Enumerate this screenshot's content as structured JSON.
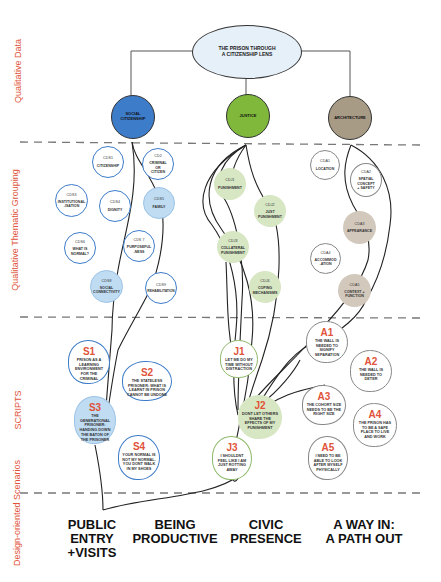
{
  "title": "THE PRISON THROUGH A CITIZENSHIP LENS",
  "colors": {
    "accent_red": "#e0533a",
    "social_citizenship": "#3d7cc9",
    "justice": "#7fb83a",
    "architecture": "#a89b85",
    "light_blue": "#bfdcf3",
    "light_green": "#d7e6c3",
    "light_tan": "#d2c8bc"
  },
  "section_labels": [
    "Qualitative Data",
    "Qualitative Thematic Grouping",
    "SCRIPTS",
    "Design-oriented Scenarios"
  ],
  "themes": [
    {
      "label": "SOCIAL CITIZENSHIP"
    },
    {
      "label": "JUSTICE"
    },
    {
      "label": "ARCHITECTURE"
    }
  ],
  "social_codes": [
    {
      "code": "CDS1",
      "text": "CITIZENSHIP",
      "filled": false
    },
    {
      "code": "CD2",
      "text": "CRIMINAL OR CITIZEN",
      "filled": false
    },
    {
      "code": "CDS3",
      "text": "INSTITUTIONAL -ISATION",
      "filled": false
    },
    {
      "code": "CDS4",
      "text": "DIGNITY",
      "filled": false
    },
    {
      "code": "CDS5",
      "text": "FAMILY",
      "filled": true
    },
    {
      "code": "CDS6",
      "text": "WHAT IS NORMAL?",
      "filled": false
    },
    {
      "code": "CDS 7",
      "text": "PURPOSEFUL -NESS",
      "filled": false
    },
    {
      "code": "CDS8",
      "text": "SOCIAL CONNECTIVITY",
      "filled": true
    },
    {
      "code": "CDS9",
      "text": "REHABILITATION",
      "filled": false
    }
  ],
  "justice_codes": [
    {
      "code": "CDJ1",
      "text": "PUNISHMENT"
    },
    {
      "code": "CDJ2",
      "text": "JUST PUNISHMENT"
    },
    {
      "code": "CDJ3",
      "text": "COLLATERAL PUNISHMENT"
    },
    {
      "code": "CDJ4",
      "text": "COPING MECHANISMS"
    }
  ],
  "architecture_codes": [
    {
      "code": "CDA1",
      "text": "LOCATION",
      "filled": false
    },
    {
      "code": "CDA2",
      "text": "SPATIAL CONCEPT + SAFETY",
      "filled": false
    },
    {
      "code": "CDA3",
      "text": "APPEARANCE",
      "filled": true
    },
    {
      "code": "CDA4",
      "text": "ACCOMMOD -ATION",
      "filled": false
    },
    {
      "code": "CDA5",
      "text": "CONTEXT + FUNCTION",
      "filled": true
    }
  ],
  "scripts": {
    "social": [
      {
        "id": "S1",
        "text": "PRISON AS A LEARNING ENVIRONMENT FOR THE CRIMINAL"
      },
      {
        "id": "S2",
        "text": "THE STATELESS PRISONER: WHAT IS LEARNT IN PRISON CANNOT BE UNDONE"
      },
      {
        "id": "S3",
        "text": "THE GENERATIONAL PRISONER: HANDING DOWN THE BATON OF THE PRISONER"
      },
      {
        "id": "S4",
        "text": "YOUR NORMAL IS NOT MY NORMAL. YOU DONT WALK IN MY SHOES"
      }
    ],
    "justice": [
      {
        "id": "J1",
        "text": "LET ME DO MY TIME WITHOUT DISTRACTION"
      },
      {
        "id": "J2",
        "text": "DONT LET OTHERS SHARE THE EFFECTS OF MY PUNISHMENT"
      },
      {
        "id": "J3",
        "text": "I SHOULDNT FEEL LIKE I AM JUST ROTTING AWAY"
      }
    ],
    "architecture": [
      {
        "id": "A1",
        "text": "THE WALL IS NEEDED TO SIGNIFY SEPARATION"
      },
      {
        "id": "A2",
        "text": "THE WALL IS NEEDED TO DETER"
      },
      {
        "id": "A3",
        "text": "THE COHORT SIZE NEEDS TO BE THE RIGHT SIZE"
      },
      {
        "id": "A4",
        "text": "THE PRISON HAS TO BE A SAFE PLACE TO LIVE AND WORK"
      },
      {
        "id": "A5",
        "text": "I NEED TO BE ABLE TO LOOK AFTER MYSELF PHYSICALLY"
      }
    ]
  },
  "scenarios": [
    "PUBLIC\nENTRY\n+VISITS",
    "BEING\nPRODUCTIVE",
    "CIVIC\nPRESENCE",
    "A WAY IN:\nA PATH OUT"
  ]
}
